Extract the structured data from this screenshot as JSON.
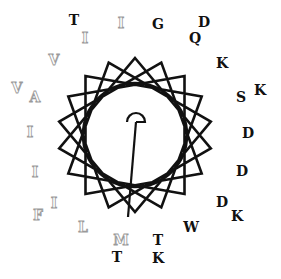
{
  "diagram": {
    "type": "helical-wheel",
    "center": [
      135,
      135
    ],
    "inner_circle_radius": 52,
    "star_vertex_radius": 77,
    "star_points": 18,
    "colors": {
      "line": "#111111",
      "polar_text": "#111111",
      "hydrophobic_outline": "#9a9a9a",
      "background": "#ffffff"
    },
    "moment_vector": {
      "arc_center": [
        136,
        122
      ],
      "arc_radius": 9,
      "tail_end": [
        128,
        217
      ]
    },
    "residues": [
      {
        "label": "T",
        "x": 74,
        "y": 25,
        "class": "polar"
      },
      {
        "label": "I",
        "x": 121,
        "y": 28,
        "class": "hydrophobic"
      },
      {
        "label": "G",
        "x": 158,
        "y": 29,
        "class": "polar"
      },
      {
        "label": "D",
        "x": 204,
        "y": 27,
        "class": "polar"
      },
      {
        "label": "I",
        "x": 85,
        "y": 43,
        "class": "hydrophobic"
      },
      {
        "label": "Q",
        "x": 195,
        "y": 43,
        "class": "polar"
      },
      {
        "label": "V",
        "x": 54,
        "y": 65,
        "class": "hydrophobic"
      },
      {
        "label": "K",
        "x": 222,
        "y": 68,
        "class": "polar"
      },
      {
        "label": "V",
        "x": 17,
        "y": 93,
        "class": "hydrophobic"
      },
      {
        "label": "A",
        "x": 35,
        "y": 102,
        "class": "hydrophobic"
      },
      {
        "label": "S",
        "x": 241,
        "y": 102,
        "class": "polar"
      },
      {
        "label": "K",
        "x": 260,
        "y": 95,
        "class": "polar"
      },
      {
        "label": "I",
        "x": 30,
        "y": 137,
        "class": "hydrophobic"
      },
      {
        "label": "D",
        "x": 248,
        "y": 138,
        "class": "polar"
      },
      {
        "label": "I",
        "x": 35,
        "y": 177,
        "class": "hydrophobic"
      },
      {
        "label": "D",
        "x": 242,
        "y": 176,
        "class": "polar"
      },
      {
        "label": "I",
        "x": 54,
        "y": 208,
        "class": "hydrophobic"
      },
      {
        "label": "F",
        "x": 38,
        "y": 220,
        "class": "hydrophobic"
      },
      {
        "label": "D",
        "x": 222,
        "y": 207,
        "class": "polar"
      },
      {
        "label": "K",
        "x": 237,
        "y": 221,
        "class": "polar"
      },
      {
        "label": "L",
        "x": 83,
        "y": 232,
        "class": "hydrophobic"
      },
      {
        "label": "W",
        "x": 191,
        "y": 232,
        "class": "polar"
      },
      {
        "label": "M",
        "x": 121,
        "y": 245,
        "class": "hydrophobic"
      },
      {
        "label": "T",
        "x": 158,
        "y": 245,
        "class": "polar"
      },
      {
        "label": "T",
        "x": 117,
        "y": 262,
        "class": "polar"
      },
      {
        "label": "K",
        "x": 158,
        "y": 263,
        "class": "polar"
      }
    ]
  }
}
